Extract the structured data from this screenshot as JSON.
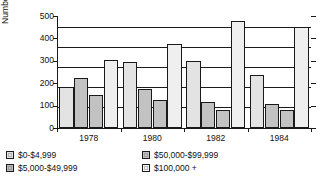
{
  "chart_data": {
    "type": "bar",
    "title": "",
    "xlabel": "",
    "ylabel": "Number of Candidates",
    "categories": [
      "1978",
      "1980",
      "1982",
      "1984"
    ],
    "ylim": [
      0,
      560
    ],
    "yticks": [
      0,
      100,
      200,
      300,
      400,
      500
    ],
    "ytick_labels": [
      "0",
      "100",
      "200",
      "300",
      "400",
      "500"
    ],
    "grid": true,
    "legend_position": "bottom",
    "series": [
      {
        "name": "$0-$4,999",
        "color": "#e3e3e3",
        "values": [
          205,
          330,
          335,
          265
        ]
      },
      {
        "name": "$5,000-$49,999",
        "color": "#c2c2c2",
        "values": [
          248,
          193,
          130,
          120
        ]
      },
      {
        "name": "$50,000-$99,999",
        "color": "#c2c2c2",
        "values": [
          163,
          140,
          88,
          88
        ]
      },
      {
        "name": "$100,000 +",
        "color": "#efefef",
        "values": [
          338,
          418,
          535,
          505
        ]
      }
    ]
  },
  "axis": {
    "ylabel": "Number of Candidates",
    "ytick_0": "0",
    "ytick_1": "100",
    "ytick_2": "200",
    "ytick_3": "300",
    "ytick_4": "400",
    "ytick_5": "500",
    "xtick_0": "1978",
    "xtick_1": "1980",
    "xtick_2": "1982",
    "xtick_3": "1984"
  },
  "legend": {
    "items": [
      {
        "label": "$0-$4,999",
        "color": "#e3e3e3"
      },
      {
        "label": "$5,000-$49,999",
        "color": "#b9b9b9"
      },
      {
        "label": "$50,000-$99,999",
        "color": "#c2c2c2"
      },
      {
        "label": "$100,000 +",
        "color": "#f4f4f4"
      }
    ]
  }
}
